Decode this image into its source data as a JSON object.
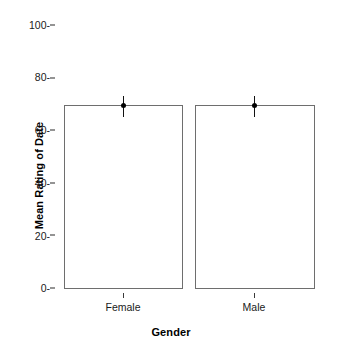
{
  "chart_data": {
    "type": "bar",
    "title": "",
    "subtitle": "",
    "xlabel": "Gender",
    "ylabel": "Mean Rating of Date",
    "categories": [
      "Female",
      "Male"
    ],
    "values": [
      69.4,
      69.4
    ],
    "series": [
      {
        "name": "Mean Rating of Date",
        "values": [
          69.4,
          69.4
        ],
        "error_low": [
          66.0,
          66.2
        ],
        "error_high": [
          72.6,
          72.5
        ]
      }
    ],
    "error_bars": true,
    "markers": [
      "filled-circle",
      "filled-circle"
    ],
    "ylim": [
      0,
      100
    ],
    "yticks": [
      0,
      20,
      40,
      60,
      80,
      100
    ],
    "ytick_labels": [
      "0-",
      "20-",
      "40-",
      "60-",
      "80-",
      "100-"
    ],
    "xtick_labels": [
      "Female",
      "Male"
    ],
    "grid": false,
    "legend": null,
    "legend_position": "none",
    "bar_fill_color": "#ffffff",
    "bar_edge_color": "#6e6e6e",
    "error_color": "#111111",
    "background_color": "#ffffff",
    "text_color": "#1a1a1a"
  },
  "axes": {
    "y": {
      "title": "Mean Rating of Date",
      "ticks": [
        {
          "label": "100-",
          "value": 100
        },
        {
          "label": "80-",
          "value": 80
        },
        {
          "label": "60-",
          "value": 60
        },
        {
          "label": "40-",
          "value": 40
        },
        {
          "label": "20-",
          "value": 20
        },
        {
          "label": "0-",
          "value": 0
        }
      ]
    },
    "x": {
      "title": "Gender",
      "ticks": [
        {
          "label": "Female",
          "value": 0
        },
        {
          "label": "Male",
          "value": 1
        }
      ]
    }
  }
}
